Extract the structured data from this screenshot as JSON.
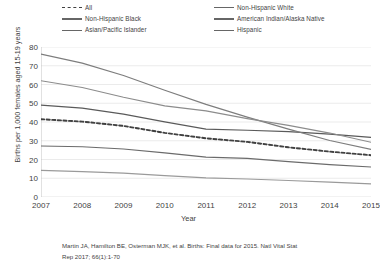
{
  "chart_data": {
    "type": "line",
    "title": "",
    "xlabel": "Year",
    "ylabel": "Births per 1,000 females aged 15-19 years",
    "x": [
      2007,
      2008,
      2009,
      2010,
      2011,
      2012,
      2013,
      2014,
      2015
    ],
    "xtick_labels": [
      "2007",
      "2008",
      "2009",
      "2010",
      "2011",
      "2012",
      "2013",
      "2014",
      "2015"
    ],
    "ytick_labels": [
      "0",
      "10",
      "20",
      "30",
      "40",
      "50",
      "60",
      "70",
      "80"
    ],
    "yticks": [
      0,
      10,
      20,
      30,
      40,
      50,
      60,
      70,
      80
    ],
    "ylim": [
      0,
      80
    ],
    "xlim": [
      2007,
      2015
    ],
    "grid": "horizontal",
    "legend_position": "top",
    "legend_columns": 2,
    "series": [
      {
        "name": "All",
        "style": "dashed",
        "color": "#404040",
        "values": [
          41.5,
          40.2,
          37.9,
          34.2,
          31.3,
          29.4,
          26.5,
          24.2,
          22.3
        ]
      },
      {
        "name": "Non-Hispanic Black",
        "style": "solid",
        "color": "#5a5a5a",
        "values": [
          49.0,
          47.4,
          44.2,
          40.1,
          36.2,
          35.6,
          34.9,
          33.5,
          31.8
        ]
      },
      {
        "name": "Asian/Pacific Islander",
        "style": "solid",
        "color": "#9a9a9a",
        "values": [
          14.2,
          13.5,
          12.7,
          11.4,
          10.2,
          9.6,
          8.8,
          7.9,
          7.0
        ]
      },
      {
        "name": "Non-Hispanic White",
        "style": "solid",
        "color": "#6b6b6b",
        "values": [
          27.2,
          26.8,
          25.6,
          23.5,
          21.3,
          20.6,
          18.9,
          17.3,
          16.0
        ]
      },
      {
        "name": "American Indian/Alaska Native",
        "style": "solid",
        "color": "#7d7d7d",
        "values": [
          76.2,
          71.4,
          64.8,
          56.9,
          49.4,
          42.6,
          36.2,
          30.1,
          25.4
        ]
      },
      {
        "name": "Hispanic",
        "style": "solid",
        "color": "#8c8c8c",
        "values": [
          62.0,
          58.4,
          53.2,
          48.6,
          45.9,
          41.8,
          38.2,
          34.1,
          29.2
        ]
      }
    ]
  },
  "legend": {
    "column_left": [
      {
        "label": "All",
        "style": "dashed"
      },
      {
        "label": "Non-Hispanic Black",
        "style": "solid"
      },
      {
        "label": "Asian/Pacific Islander",
        "style": "solid"
      }
    ],
    "column_right": [
      {
        "label": "Non-Hispanic White",
        "style": "solid"
      },
      {
        "label": "American Indian/Alaska Native",
        "style": "solid"
      },
      {
        "label": "Hispanic",
        "style": "solid"
      }
    ]
  },
  "citation": {
    "line1": "Martin JA, Hamilton BE, Osterman MJK, et al. Births: Final data for 2015. Natl Vital Stat",
    "line2": "Rep 2017; 66(1):1-70"
  }
}
